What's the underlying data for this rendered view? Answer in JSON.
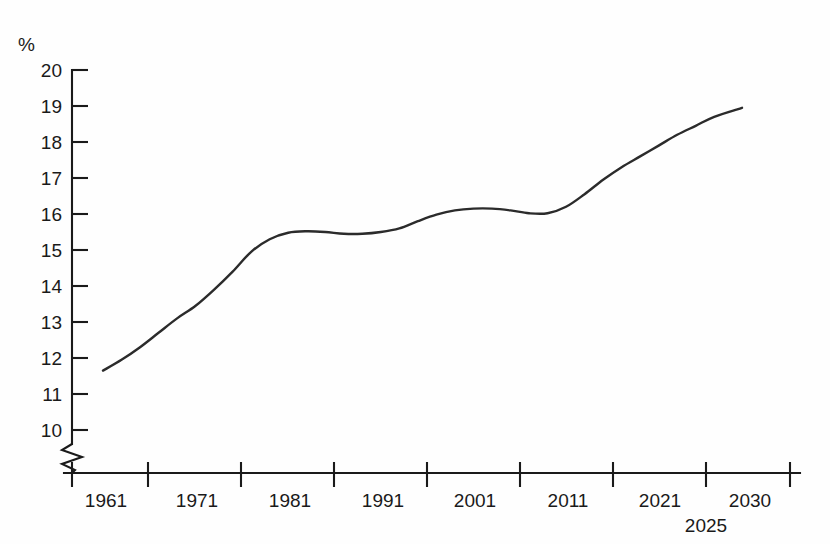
{
  "chart_data": {
    "type": "line",
    "title": "",
    "subtitle": "",
    "xlabel": "",
    "ylabel": "%",
    "y_unit_label": "%",
    "xlim": [
      1957.5,
      2034.5
    ],
    "ylim": [
      9.6,
      20
    ],
    "y_axis_break": true,
    "y_axis_break_note": "zigzag break on vertical axis below 10",
    "grid": false,
    "legend": null,
    "ytick_labels": [
      "20",
      "19",
      "18",
      "17",
      "16",
      "15",
      "14",
      "13",
      "12",
      "11",
      "10"
    ],
    "ytick_values": [
      20,
      19,
      18,
      17,
      16,
      15,
      14,
      13,
      12,
      11,
      10
    ],
    "xtick_labels": [
      "1961",
      "1971",
      "1981",
      "1991",
      "2001",
      "2011",
      "2021",
      "2030"
    ],
    "xtick_sublabels": [
      "2025"
    ],
    "x": [
      1961,
      1963,
      1965,
      1967,
      1969,
      1971,
      1973,
      1975,
      1977,
      1979,
      1981,
      1983,
      1985,
      1987,
      1989,
      1991,
      1993,
      1995,
      1997,
      1999,
      2001,
      2003,
      2005,
      2007,
      2009,
      2011,
      2013,
      2015,
      2017,
      2019,
      2021,
      2023,
      2025,
      2027,
      2030
    ],
    "values": [
      11.65,
      11.95,
      12.3,
      12.7,
      13.1,
      13.45,
      13.9,
      14.4,
      14.95,
      15.3,
      15.48,
      15.52,
      15.5,
      15.45,
      15.45,
      15.5,
      15.6,
      15.8,
      15.98,
      16.1,
      16.15,
      16.15,
      16.1,
      16.02,
      16.02,
      16.2,
      16.55,
      16.95,
      17.3,
      17.6,
      17.9,
      18.2,
      18.45,
      18.7,
      18.95
    ],
    "series": [
      {
        "name": "percentage",
        "values": [
          11.65,
          11.95,
          12.3,
          12.7,
          13.1,
          13.45,
          13.9,
          14.4,
          14.95,
          15.3,
          15.48,
          15.52,
          15.5,
          15.45,
          15.45,
          15.5,
          15.6,
          15.8,
          15.98,
          16.1,
          16.15,
          16.15,
          16.1,
          16.02,
          16.02,
          16.2,
          16.55,
          16.95,
          17.3,
          17.6,
          17.9,
          18.2,
          18.45,
          18.7,
          18.95
        ]
      }
    ],
    "line_color": "#2b2b2b",
    "axis_color": "#1a1a1a",
    "background_color": "#fefefe",
    "start_value": 11.65,
    "end_value": 18.95
  }
}
